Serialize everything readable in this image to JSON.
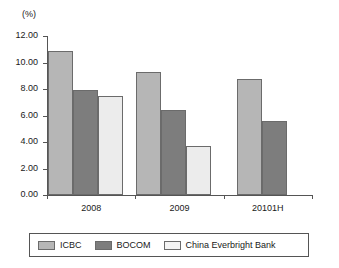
{
  "chart_data": {
    "type": "bar",
    "title": "",
    "subtitle": "",
    "xlabel": "",
    "ylabel": "(%)",
    "categories": [
      "2008",
      "2009",
      "20101H"
    ],
    "series": [
      {
        "name": "ICBC",
        "values": [
          10.9,
          9.3,
          8.75
        ],
        "color": "#b6b6b6"
      },
      {
        "name": "BOCOM",
        "values": [
          7.9,
          6.4,
          5.55
        ],
        "color": "#7d7d7d"
      },
      {
        "name": "China Everbright Bank",
        "values": [
          7.45,
          3.7,
          null
        ],
        "color": "#ececec"
      }
    ],
    "ylim": [
      0,
      12
    ],
    "ytick_step": 2,
    "ytick_labels": [
      "0.00",
      "2.00",
      "4.00",
      "6.00",
      "8.00",
      "10.00",
      "12.00"
    ],
    "grid": false,
    "legend_position": "bottom",
    "orientation": "vertical",
    "grouping": "clustered"
  },
  "axes": {
    "y_unit_label": "(%)",
    "y_ticks": [
      {
        "label": "12.00",
        "value": 12
      },
      {
        "label": "10.00",
        "value": 10
      },
      {
        "label": "8.00",
        "value": 8
      },
      {
        "label": "6.00",
        "value": 6
      },
      {
        "label": "4.00",
        "value": 4
      },
      {
        "label": "2.00",
        "value": 2
      },
      {
        "label": "0.00",
        "value": 0
      }
    ],
    "x_labels": [
      "2008",
      "2009",
      "20101H"
    ]
  },
  "legend": {
    "entries": [
      {
        "label": "ICBC",
        "swatch": "legend-swatch-icbc"
      },
      {
        "label": "BOCOM",
        "swatch": "legend-swatch-bocom"
      },
      {
        "label": "China Everbright Bank",
        "swatch": "legend-swatch-china-everbright-bank"
      }
    ]
  },
  "colors": {
    "series_icbc": "#b6b6b6",
    "series_bocom": "#7d7d7d",
    "series_ceb": "#ececec",
    "axis": "#555555",
    "text": "#1a1a1a",
    "background": "#ffffff"
  }
}
